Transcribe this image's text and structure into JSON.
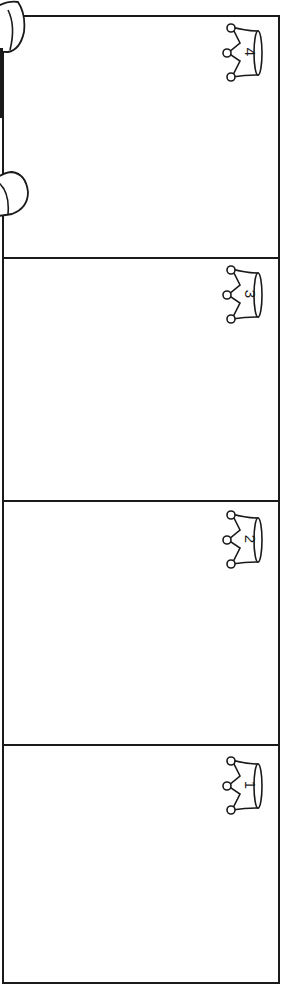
{
  "board": {
    "stroke_color": "#1a1a1a",
    "background": "#ffffff",
    "panels": [
      {
        "position": "top",
        "crown_number": "4"
      },
      {
        "position": "upper-middle",
        "crown_number": "3"
      },
      {
        "position": "lower-middle",
        "crown_number": "2"
      },
      {
        "position": "bottom",
        "crown_number": "1"
      }
    ]
  },
  "left_clips": [
    {
      "name": "top-clip"
    },
    {
      "name": "bottom-clip"
    }
  ]
}
